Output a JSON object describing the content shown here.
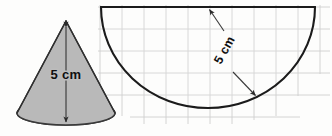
{
  "figure": {
    "background_color": "#fdfdfc",
    "labels": {
      "cone_height": "5 cm",
      "sector_radius": "5 cm"
    },
    "colors": {
      "cone_lateral_fill": "#b9b9b9",
      "cone_base_fill": "#8e8e8e",
      "outline": "#1b1b1b",
      "grid_line": "#cfcfcf",
      "dimension_line": "#3a3a3a",
      "text": "#101010"
    },
    "cone": {
      "name": "grey-cone",
      "apex": {
        "x": 66,
        "y": 21
      },
      "base_center": {
        "x": 66,
        "y": 113
      },
      "base_radius_x": 49,
      "base_radius_y": 12,
      "height_arrow": {
        "from": {
          "x": 66,
          "y": 24
        },
        "to": {
          "x": 66,
          "y": 124
        },
        "double_headed": true
      },
      "label": "5 cm"
    },
    "semicircle": {
      "name": "semicircular-sector",
      "center": {
        "x": 208,
        "y": 7
      },
      "radius_x": 107,
      "radius_y": 101,
      "diameter_left": {
        "x": 101,
        "y": 7
      },
      "diameter_right": {
        "x": 315,
        "y": 7
      },
      "arc_bottom": {
        "x": 208,
        "y": 108
      },
      "label": "5 cm",
      "radius_arrow_upper": {
        "from": {
          "x": 224,
          "y": 30
        },
        "to": {
          "x": 208,
          "y": 8
        }
      },
      "radius_arrow_lower": {
        "from": {
          "x": 233,
          "y": 72
        },
        "to": {
          "x": 257,
          "y": 97
        }
      }
    },
    "grid": {
      "name": "graph-paper-grid",
      "cell_size": 22,
      "x_start": 98,
      "x_end": 330,
      "y_start": 6,
      "y_end": 126,
      "line_color": "#cfcfcf"
    }
  }
}
